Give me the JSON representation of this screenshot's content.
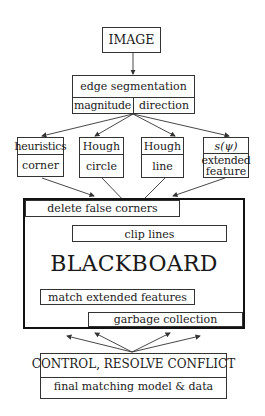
{
  "diagram": {
    "image_box": {
      "label": "IMAGE"
    },
    "edge_segmentation": {
      "title": "edge segmentation",
      "left": "magnitude",
      "right": "direction"
    },
    "detectors": [
      {
        "top": "heuristics",
        "bottom": "corner"
      },
      {
        "top": "Hough",
        "bottom": "circle"
      },
      {
        "top": "Hough",
        "bottom": "line"
      },
      {
        "top": "s(ψ)",
        "bottom_line1": "extended",
        "bottom_line2": "feature"
      }
    ],
    "blackboard": {
      "title": "BLACKBOARD",
      "processes": [
        "delete false corners",
        "clip lines",
        "match extended features",
        "garbage collection"
      ]
    },
    "control": {
      "title": "CONTROL, RESOLVE CONFLICT",
      "subtitle": "final matching model & data"
    }
  }
}
